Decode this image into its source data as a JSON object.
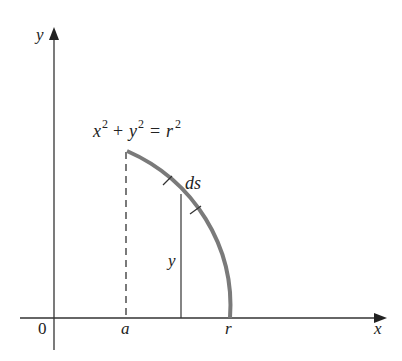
{
  "diagram": {
    "axes": {
      "x_label": "x",
      "y_label": "y",
      "origin_label": "0"
    },
    "ticks": {
      "a_label": "a",
      "r_label": "r"
    },
    "curve": {
      "equation_lhs_x": "x",
      "equation_lhs_y": "y",
      "equation_rhs": "r",
      "exponent": "2",
      "plus": "+",
      "equals": "=",
      "arc_element_label": "ds",
      "height_label": "y"
    },
    "colors": {
      "axis": "#333333",
      "curve": "#7a7a7a",
      "text": "#222222"
    }
  }
}
